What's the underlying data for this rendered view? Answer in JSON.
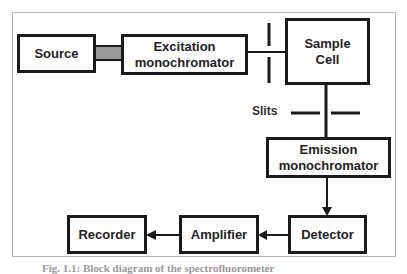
{
  "diagram": {
    "nodes": {
      "source": {
        "label": "Source"
      },
      "excitation": {
        "line1": "Excitation",
        "line2": "monochromator"
      },
      "sample": {
        "line1": "Sample",
        "line2": "Cell"
      },
      "emission": {
        "line1": "Emission",
        "line2": "monochromator"
      },
      "detector": {
        "label": "Detector"
      },
      "amplifier": {
        "label": "Amplifier"
      },
      "recorder": {
        "label": "Recorder"
      }
    },
    "slits_label": "Slits",
    "edges": [
      {
        "from": "Source",
        "to": "Excitation monochromator",
        "style": "thick grey beam"
      },
      {
        "from": "Excitation monochromator",
        "to": "Sample Cell",
        "style": "line through slit"
      },
      {
        "from": "Sample Cell",
        "to": "Emission monochromator",
        "style": "line through slit"
      },
      {
        "from": "Emission monochromator",
        "to": "Detector",
        "style": "arrow"
      },
      {
        "from": "Detector",
        "to": "Amplifier",
        "style": "arrow"
      },
      {
        "from": "Amplifier",
        "to": "Recorder",
        "style": "arrow"
      }
    ],
    "caption": "Fig. 1.1: Block diagram of the spectrofluorometer"
  },
  "colors": {
    "box_border": "#1a1a1a",
    "beam_fill": "#9a9a9a",
    "frame_border": "#b8b8b8"
  }
}
